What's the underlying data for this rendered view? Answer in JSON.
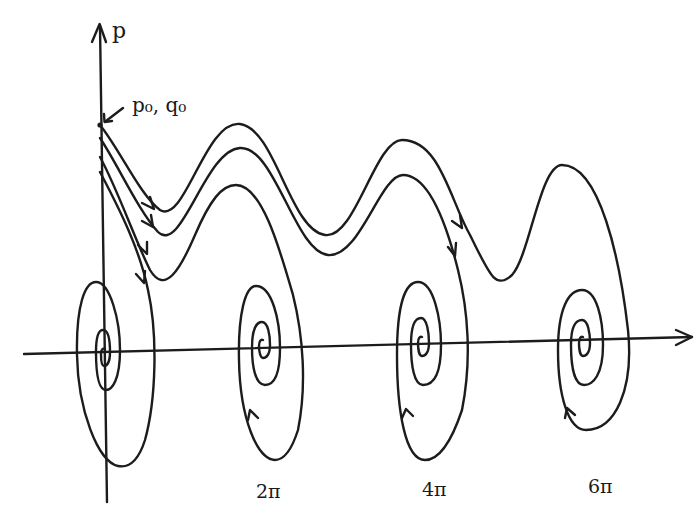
{
  "diagram": {
    "axes": {
      "x_label": "q",
      "y_label": "p"
    },
    "initial_point_label": "p₀, q₀",
    "tick_labels": [
      "2π",
      "4π",
      "6π"
    ],
    "equilibria": [
      "0",
      "2π",
      "4π",
      "6π"
    ],
    "trajectories": [
      {
        "name": "trajectory-to-6pi",
        "ends_at": "6π"
      },
      {
        "name": "trajectory-to-4pi",
        "ends_at": "4π"
      },
      {
        "name": "trajectory-to-2pi",
        "ends_at": "2π"
      },
      {
        "name": "trajectory-to-0",
        "ends_at": "0"
      }
    ],
    "stroke_color": "#1c1c1c",
    "background_color": "#ffffff"
  }
}
